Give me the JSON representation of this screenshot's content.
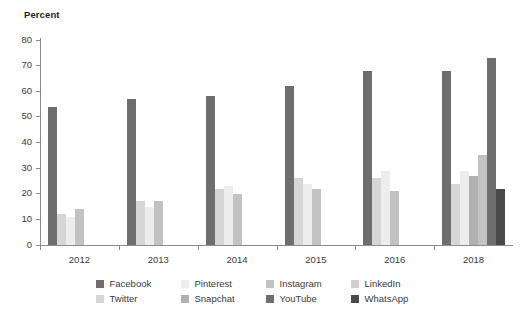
{
  "chart_data": {
    "type": "bar",
    "title": "",
    "subtitle": "",
    "xlabel": "",
    "ylabel": "Percent",
    "ylim": [
      0,
      80
    ],
    "yticks": [
      0,
      10,
      20,
      30,
      40,
      50,
      60,
      70,
      80
    ],
    "grid": false,
    "legend_position": "bottom",
    "categories": [
      "2012",
      "2013",
      "2014",
      "2015",
      "2016",
      "2018"
    ],
    "series": [
      {
        "name": "Facebook",
        "color": "#6e6e6e",
        "values": [
          54,
          57,
          58,
          62,
          68,
          68
        ]
      },
      {
        "name": "Twitter",
        "color": "#d6d6d6",
        "values": [
          12,
          17,
          22,
          26,
          26,
          24
        ]
      },
      {
        "name": "Pinterest",
        "color": "#ededed",
        "values": [
          11,
          15,
          23,
          24,
          29,
          29
        ]
      },
      {
        "name": "Snapchat",
        "color": "#b0b0b0",
        "values": [
          null,
          null,
          null,
          null,
          null,
          27
        ]
      },
      {
        "name": "Instagram",
        "color": "#c2c2c2",
        "values": [
          14,
          17,
          20,
          22,
          21,
          35
        ]
      },
      {
        "name": "YouTube",
        "color": "#6e6e6e",
        "values": [
          null,
          null,
          null,
          null,
          null,
          73
        ]
      },
      {
        "name": "LinkedIn",
        "color": "#cfcfcf",
        "values": [
          null,
          null,
          null,
          null,
          null,
          null
        ]
      },
      {
        "name": "WhatsApp",
        "color": "#4a4a4a",
        "values": [
          null,
          null,
          null,
          null,
          null,
          22
        ]
      }
    ]
  },
  "legend": {
    "row1": [
      {
        "label": "Facebook",
        "color": "#6e6e6e"
      },
      {
        "label": "Pinterest",
        "color": "#ededed"
      },
      {
        "label": "Instagram",
        "color": "#c2c2c2"
      },
      {
        "label": "LinkedIn",
        "color": "#cfcfcf"
      }
    ],
    "row2": [
      {
        "label": "Twitter",
        "color": "#d6d6d6"
      },
      {
        "label": "Snapchat",
        "color": "#b0b0b0"
      },
      {
        "label": "YouTube",
        "color": "#6e6e6e"
      },
      {
        "label": "WhatsApp",
        "color": "#4a4a4a"
      }
    ]
  }
}
